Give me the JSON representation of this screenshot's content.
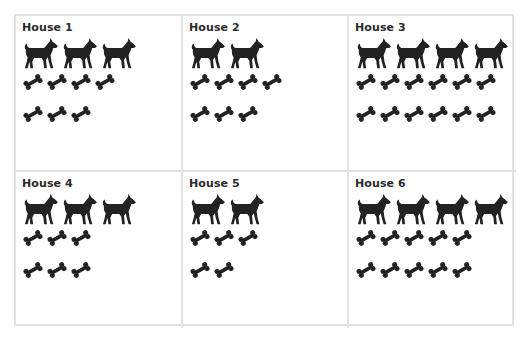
{
  "chart_data": {
    "type": "table",
    "title": "",
    "columns": [
      "House",
      "Dogs",
      "Bones"
    ],
    "rows": [
      {
        "house": "House 1",
        "dogs": 3,
        "bones": 7,
        "bone_rows": [
          4,
          3
        ]
      },
      {
        "house": "House 2",
        "dogs": 2,
        "bones": 7,
        "bone_rows": [
          4,
          3
        ]
      },
      {
        "house": "House 3",
        "dogs": 4,
        "bones": 12,
        "bone_rows": [
          6,
          6
        ]
      },
      {
        "house": "House 4",
        "dogs": 3,
        "bones": 6,
        "bone_rows": [
          3,
          3
        ]
      },
      {
        "house": "House 5",
        "dogs": 2,
        "bones": 5,
        "bone_rows": [
          3,
          2
        ]
      },
      {
        "house": "House 6",
        "dogs": 4,
        "bones": 10,
        "bone_rows": [
          5,
          5
        ]
      }
    ],
    "icons": {
      "dog": "dog-icon",
      "bone": "bone-icon"
    },
    "layout": {
      "grid_cols": 3,
      "grid_rows": 2,
      "dogs_per_row": 3
    },
    "colors": {
      "icon": "#222222",
      "border": "#e2e2e2",
      "text": "#2b2b2b"
    }
  }
}
